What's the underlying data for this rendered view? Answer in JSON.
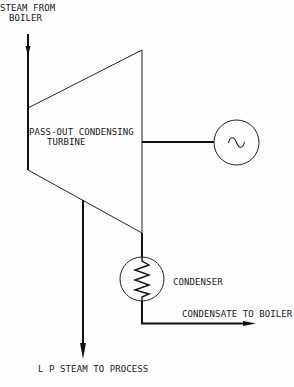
{
  "diagram": {
    "colors": {
      "line": "#111111",
      "background": "#fdfdfd"
    },
    "labels": {
      "steam_inlet_line1": "STEAM FROM",
      "steam_inlet_line2": "BOILER",
      "turbine_line1": "PASS-OUT CONDENSING",
      "turbine_line2": "TURBINE",
      "condenser": "CONDENSER",
      "condensate": "CONDENSATE TO BOILER",
      "lp_steam": "L P  STEAM TO PROCESS"
    },
    "nodes": [
      {
        "id": "turbine",
        "label": "PASS-OUT CONDENSING TURBINE",
        "shape": "trapezoid"
      },
      {
        "id": "generator",
        "label": "",
        "shape": "circle",
        "icon": "ac-tilde-icon",
        "glyph": "~"
      },
      {
        "id": "condenser",
        "label": "CONDENSER",
        "shape": "circle",
        "icon": "zigzag-coil-icon"
      }
    ],
    "edges": [
      {
        "from": "boiler",
        "to": "turbine",
        "label": "STEAM FROM BOILER"
      },
      {
        "from": "turbine",
        "to": "generator",
        "label": ""
      },
      {
        "from": "turbine",
        "to": "condenser",
        "label": ""
      },
      {
        "from": "turbine",
        "to": "process",
        "label": "L P STEAM TO PROCESS"
      },
      {
        "from": "condenser",
        "to": "boiler",
        "label": "CONDENSATE TO BOILER"
      }
    ],
    "generator_glyph": "~"
  }
}
